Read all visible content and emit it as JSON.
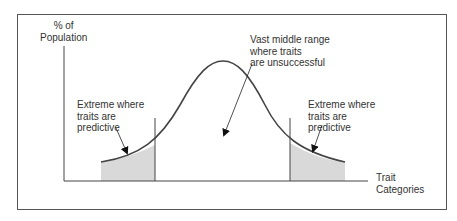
{
  "diagram": {
    "type": "bell-curve",
    "y_axis_label": "% of\nPopulation",
    "x_axis_label": "Trait\nCategories",
    "annotations": {
      "left_extreme": "Extreme where\ntraits are\npredictive",
      "middle": "Vast middle range\nwhere traits\nare unsuccessful",
      "right_extreme": "Extreme where\ntraits are\npredictive"
    },
    "colors": {
      "line": "#444444",
      "shade": "#d9d9d9",
      "frame": "#555555"
    }
  }
}
